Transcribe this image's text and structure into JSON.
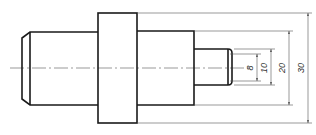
{
  "drawing": {
    "type": "stepped-shaft-technical-drawing",
    "dimensions": [
      {
        "id": "d8",
        "label": "8"
      },
      {
        "id": "d10",
        "label": "10"
      },
      {
        "id": "d20",
        "label": "20"
      },
      {
        "id": "d30",
        "label": "30"
      }
    ]
  }
}
